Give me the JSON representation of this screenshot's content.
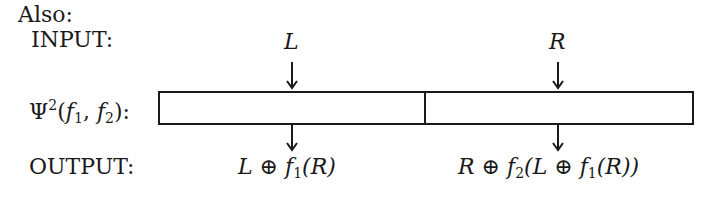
{
  "header": {
    "also_label": "Also:"
  },
  "rows": {
    "input_label": "INPUT:",
    "function_label": {
      "psi": "Ψ",
      "sup": "2",
      "open": "(",
      "f1": "f",
      "f1_sub": "1",
      "comma": ", ",
      "f2": "f",
      "f2_sub": "2",
      "close": "):"
    },
    "output_label": "OUTPUT:"
  },
  "inputs": {
    "left": "L",
    "right": "R"
  },
  "outputs": {
    "left": {
      "a": "L ⊕ ",
      "f": "f",
      "sub": "1",
      "rest": "(R)"
    },
    "right": {
      "a": "R ⊕ ",
      "f": "f",
      "sub": "2",
      "mid": "(L ⊕ ",
      "f2": "f",
      "sub2": "1",
      "rest": "(R))"
    }
  },
  "diagram": {
    "box": {
      "left": 158,
      "top": 91,
      "right": 693,
      "bottom": 124,
      "divider_x": 425
    },
    "arrows": [
      {
        "x": 292,
        "y1": 62,
        "y2": 88
      },
      {
        "x": 558,
        "y1": 62,
        "y2": 88
      },
      {
        "x": 292,
        "y1": 124,
        "y2": 150
      },
      {
        "x": 558,
        "y1": 124,
        "y2": 150
      }
    ],
    "stroke_color": "#1a1a1a"
  }
}
